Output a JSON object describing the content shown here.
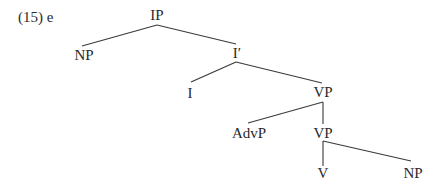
{
  "example_label": "(15) e",
  "tree": {
    "nodes": {
      "ip": "IP",
      "np_subject": "NP",
      "i_bar": "I′",
      "i": "I",
      "vp_upper": "VP",
      "advp": "AdvP",
      "vp_lower": "VP",
      "v": "V",
      "np_object": "NP"
    },
    "edges": [
      [
        "IP",
        "NP"
      ],
      [
        "IP",
        "I′"
      ],
      [
        "I′",
        "I"
      ],
      [
        "I′",
        "VP"
      ],
      [
        "VP",
        "AdvP"
      ],
      [
        "VP",
        "VP"
      ],
      [
        "VP",
        "V"
      ],
      [
        "VP",
        "NP"
      ]
    ]
  }
}
